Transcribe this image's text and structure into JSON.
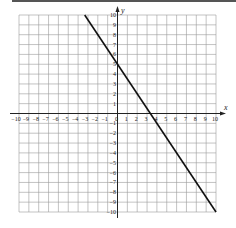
{
  "chart_data": {
    "type": "line",
    "title": "",
    "xlabel": "x",
    "ylabel": "y",
    "xlim": [
      -10,
      10
    ],
    "ylim": [
      -10,
      10
    ],
    "grid": true,
    "x_ticks": [
      -10,
      -9,
      -8,
      -7,
      -6,
      -5,
      -4,
      -3,
      -2,
      -1,
      0,
      1,
      2,
      3,
      4,
      5,
      6,
      7,
      8,
      9,
      10
    ],
    "y_ticks": [
      -10,
      -9,
      -8,
      -7,
      -6,
      -5,
      -4,
      -3,
      -2,
      -1,
      1,
      2,
      3,
      4,
      5,
      6,
      7,
      8,
      9,
      10
    ],
    "series": [
      {
        "name": "y = -1.5x + 5",
        "equation": "y = -3/2 x + 5",
        "slope": -1.5,
        "y_intercept": 5,
        "x_intercept": 3.33,
        "points": [
          [
            -3.33,
            10
          ],
          [
            0,
            5
          ],
          [
            3.33,
            0
          ],
          [
            10,
            -10
          ]
        ],
        "color": "#111111"
      }
    ]
  },
  "labels": {
    "x_axis": "x",
    "y_axis": "y"
  }
}
